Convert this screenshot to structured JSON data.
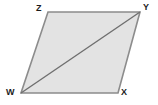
{
  "figure": {
    "kind": "parallelogram-with-diagonal",
    "canvas": {
      "width": 158,
      "height": 105,
      "background": "#ffffff"
    },
    "style": {
      "fill": "#e3e3e3",
      "stroke": "#8c8c8c",
      "stroke_width": 1.6,
      "diagonal_stroke": "#6f6f6f",
      "diagonal_width": 1.4,
      "label_color": "#1b1b1b"
    },
    "vertices": [
      {
        "name": "W",
        "label": "W",
        "x": 21,
        "y": 93,
        "label_x": 6,
        "label_y": 88
      },
      {
        "name": "X",
        "label": "X",
        "x": 118,
        "y": 93,
        "label_x": 121,
        "label_y": 88
      },
      {
        "name": "Y",
        "label": "Y",
        "x": 140,
        "y": 12,
        "label_x": 143,
        "label_y": 3
      },
      {
        "name": "Z",
        "label": "Z",
        "x": 48,
        "y": 12,
        "label_x": 36,
        "label_y": 4
      }
    ],
    "polygon_points": "48,12 140,12 118,93 21,93",
    "diagonal": {
      "from": "W",
      "to": "Y",
      "x1": 21,
      "y1": 93,
      "x2": 140,
      "y2": 12
    },
    "edges": [
      {
        "name": "ZY",
        "from": "Z",
        "to": "Y"
      },
      {
        "name": "YX",
        "from": "Y",
        "to": "X"
      },
      {
        "name": "XW",
        "from": "X",
        "to": "W"
      },
      {
        "name": "WZ",
        "from": "W",
        "to": "Z"
      }
    ]
  }
}
